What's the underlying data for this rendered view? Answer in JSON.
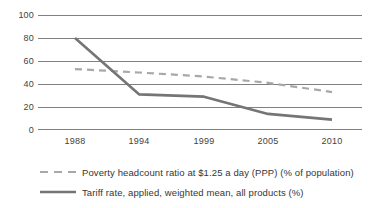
{
  "chart_data": {
    "type": "line",
    "title": "",
    "xlabel": "",
    "ylabel": "",
    "categories": [
      "1988",
      "1994",
      "1999",
      "2005",
      "2010"
    ],
    "ylim": [
      0,
      100
    ],
    "ytick_values": [
      0,
      20,
      40,
      60,
      80,
      100
    ],
    "ytick_labels": [
      "0",
      "20",
      "40",
      "60",
      "80",
      "100"
    ],
    "grid": true,
    "grid_axis": "y",
    "legend_position": "bottom",
    "series": [
      {
        "name": "Poverty headcount ratio at $1.25 a day (PPP) (% of population)",
        "values": [
          53,
          50,
          46.5,
          41,
          33
        ],
        "style": "dashed",
        "color": "#a8a8a8",
        "width": 2.2
      },
      {
        "name": "Tariff rate, applied, weighted mean, all products (%)",
        "values": [
          80,
          31,
          29,
          14,
          9
        ],
        "style": "solid",
        "color": "#757575",
        "width": 2.6
      }
    ]
  },
  "axes": {
    "y_labels": [
      "100",
      "80",
      "60",
      "40",
      "20",
      "0"
    ],
    "x_labels": [
      "1988",
      "1994",
      "1999",
      "2005",
      "2010"
    ]
  },
  "legend": {
    "items": [
      {
        "label": "Poverty headcount ratio at $1.25 a day (PPP) (% of population)",
        "marker": "dashed-line-swatch"
      },
      {
        "label": "Tariff rate, applied, weighted mean, all products (%)",
        "marker": "solid-line-swatch"
      }
    ]
  },
  "colors": {
    "gridline": "#808080",
    "poverty_series": "#a8a8a8",
    "tariff_series": "#757575",
    "text": "#3f3f3f",
    "background": "#ffffff"
  }
}
